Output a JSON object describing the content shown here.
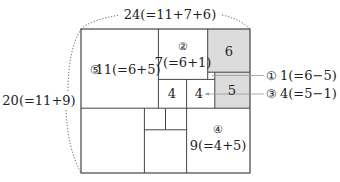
{
  "diagram": {
    "title_top": "24(=11+7+6)",
    "title_left": "20(=11+9)",
    "colors": {
      "line": "#444444",
      "shade": "#dcdcdc",
      "text": "#222222",
      "dotted": "#555555",
      "callout": "#999999"
    },
    "squares": [
      {
        "id": "sq5",
        "side": 11,
        "marker": "⑤",
        "label": "11(=6+5)",
        "shaded": false
      },
      {
        "id": "sq2",
        "side": 7,
        "marker": "②",
        "label": "7(=6+1)",
        "shaded": false
      },
      {
        "id": "sq6",
        "side": 6,
        "marker": "",
        "label": "6",
        "shaded": true
      },
      {
        "id": "sq1",
        "side": 1,
        "marker": "",
        "label": "",
        "shaded": false
      },
      {
        "id": "sq5b",
        "side": 5,
        "marker": "",
        "label": "5",
        "shaded": true
      },
      {
        "id": "sq4a",
        "side": 4,
        "marker": "",
        "label": "4",
        "shaded": false
      },
      {
        "id": "sq4b",
        "side": 4,
        "marker": "",
        "label": "4",
        "shaded": false
      },
      {
        "id": "sq9",
        "side": 9,
        "marker": "④",
        "label": "9(=4+5)",
        "shaded": false
      },
      {
        "id": "sq9b",
        "side": 9,
        "marker": "",
        "label": "",
        "shaded": false
      },
      {
        "id": "sq3a",
        "side": 3,
        "marker": "",
        "label": "",
        "shaded": false
      },
      {
        "id": "sq3b",
        "side": 3,
        "marker": "",
        "label": "",
        "shaded": false
      },
      {
        "id": "sq6b",
        "side": 6,
        "marker": "",
        "label": "",
        "shaded": false
      }
    ],
    "callouts": [
      {
        "marker": "①",
        "text": "1(=6−5)"
      },
      {
        "marker": "③",
        "text": "4(=5−1)"
      }
    ]
  }
}
